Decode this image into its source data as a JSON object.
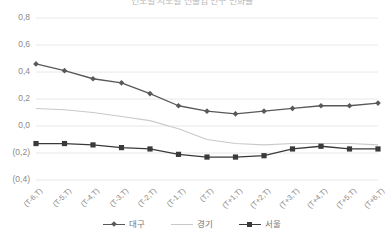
{
  "chart_title": "연도별 시도별 전출입 인구 변화율",
  "chart_data": {
    "type": "line",
    "title": "연도별 시도별 전출입 인구 변화율",
    "xlabel": "",
    "ylabel": "",
    "categories": [
      "(T-6,T)",
      "(T-5,T)",
      "(T-4,T)",
      "(T-3,T)",
      "(T-2,T)",
      "(T-1,T)",
      "(T,T)",
      "(T+1,T)",
      "(T+2,T)",
      "(T+3,T)",
      "(T+4,T)",
      "(T+5,T)",
      "(T+6,T)"
    ],
    "series": [
      {
        "name": "대구",
        "color": "#595959",
        "marker": "diamond",
        "values": [
          0.46,
          0.41,
          0.35,
          0.32,
          0.24,
          0.15,
          0.11,
          0.09,
          0.11,
          0.13,
          0.15,
          0.15,
          0.17
        ]
      },
      {
        "name": "경기",
        "color": "#c9c9c9",
        "marker": "none",
        "values": [
          0.13,
          0.12,
          0.1,
          0.07,
          0.04,
          -0.02,
          -0.1,
          -0.13,
          -0.14,
          -0.13,
          -0.13,
          -0.13,
          -0.14
        ]
      },
      {
        "name": "서울",
        "color": "#3a3a3a",
        "marker": "square",
        "values": [
          -0.13,
          -0.13,
          -0.14,
          -0.16,
          -0.17,
          -0.21,
          -0.23,
          -0.23,
          -0.22,
          -0.17,
          -0.15,
          -0.17,
          -0.17
        ]
      }
    ],
    "ylim": [
      -0.4,
      0.8
    ],
    "ytick_values": [
      0.8,
      0.6,
      0.4,
      0.2,
      0.0,
      -0.2,
      -0.4
    ],
    "ytick_labels": [
      "0,8",
      "0,6",
      "0,4",
      "0,2",
      "0,0",
      "(0,2)",
      "(0,4)"
    ],
    "grid": true,
    "grid_color": "#e8e8e8",
    "legend_position": "bottom"
  }
}
